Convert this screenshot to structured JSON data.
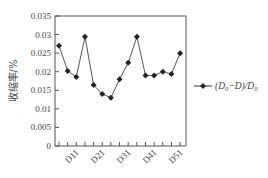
{
  "chart_data": {
    "type": "line",
    "title": "",
    "xlabel": "",
    "ylabel": "收缩率/%",
    "ylim": [
      0,
      0.035
    ],
    "yticks": [
      "0",
      "0.005",
      "0.01",
      "0.015",
      "0.02",
      "0.025",
      "0.03",
      "0.035"
    ],
    "categories": [
      "",
      "",
      "D11",
      "",
      "",
      "D21",
      "",
      "",
      "D31",
      "",
      "",
      "D41",
      "",
      "",
      "D51"
    ],
    "series": [
      {
        "name": "(D0−D)/D0",
        "marker": "diamond",
        "color": "#333333",
        "values": [
          0.027,
          0.0202,
          0.0186,
          0.0294,
          0.0164,
          0.014,
          0.013,
          0.018,
          0.0224,
          0.0294,
          0.019,
          0.019,
          0.02,
          0.0194,
          0.025
        ]
      }
    ],
    "grid": false,
    "legend_position": "right"
  },
  "legend": {
    "label_main": "(D",
    "sub0": "0",
    "label_mid": "−D)/D",
    "sub1": "0"
  },
  "axis": {
    "ylabel": "收缩率/%"
  }
}
